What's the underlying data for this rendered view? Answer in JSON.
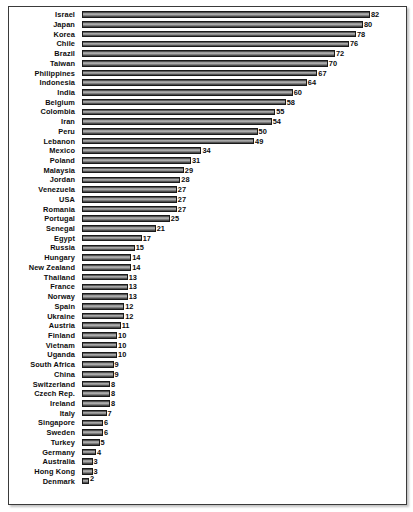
{
  "chart_data": {
    "type": "bar",
    "orientation": "horizontal",
    "title": "",
    "subtitle": "",
    "xlabel": "",
    "ylabel": "",
    "xlim": [
      0,
      82
    ],
    "grid": false,
    "legend": null,
    "value_labels_shown": true,
    "sorted": "descending",
    "categories": [
      "Israel",
      "Japan",
      "Korea",
      "Chile",
      "Brazil",
      "Taiwan",
      "Philippines",
      "Indonesia",
      "India",
      "Belgium",
      "Colombia",
      "Iran",
      "Peru",
      "Lebanon",
      "Mexico",
      "Poland",
      "Malaysia",
      "Jordan",
      "Venezuela",
      "USA",
      "Romania",
      "Portugal",
      "Senegal",
      "Egypt",
      "Russia",
      "Hungary",
      "New Zealand",
      "Thailand",
      "France",
      "Norway",
      "Spain",
      "Ukraine",
      "Austria",
      "Finland",
      "Vietnam",
      "Uganda",
      "South Africa",
      "China",
      "Switzerland",
      "Czech Rep.",
      "Ireland",
      "Italy",
      "Singapore",
      "Sweden",
      "Turkey",
      "Germany",
      "Australia",
      "Hong Kong",
      "Denmark"
    ],
    "values": [
      82,
      80,
      78,
      76,
      72,
      70,
      67,
      64,
      60,
      58,
      55,
      54,
      50,
      49,
      34,
      31,
      29,
      28,
      27,
      27,
      27,
      25,
      21,
      17,
      15,
      14,
      14,
      13,
      13,
      13,
      12,
      12,
      11,
      10,
      10,
      10,
      9,
      9,
      8,
      8,
      8,
      7,
      6,
      6,
      5,
      4,
      3,
      3,
      2
    ],
    "colors": {
      "bar_dark": "#3d3d3d",
      "bar_light": "#b4b4b4",
      "bar_border": "#1a1a1a",
      "text": "#0d0d0d",
      "frame": "#3a3a3a",
      "background": "#ffffff"
    }
  }
}
